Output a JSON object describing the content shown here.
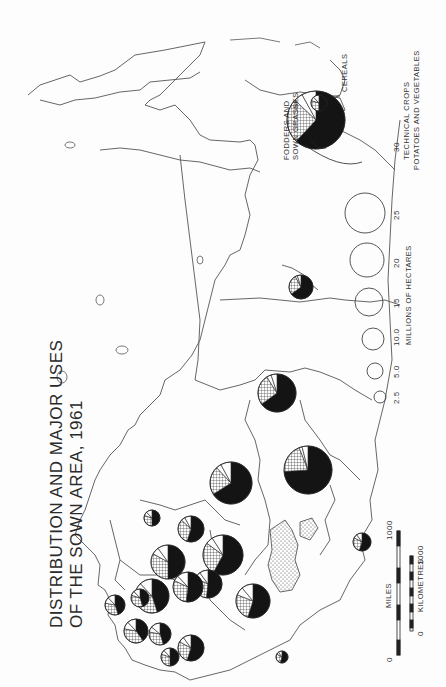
{
  "title": {
    "line1": "DISTRIBUTION AND MAJOR USES",
    "line2": "OF THE SOWN AREA, 1961"
  },
  "legend": {
    "unit_label": "MILLIONS OF HECTARES",
    "sizes": [
      "2.5",
      "5.0",
      "10.0",
      "15",
      "20",
      "25",
      "30"
    ],
    "categories": {
      "cereals": "CEREALS",
      "fodders": "FODDERS AND",
      "fodders2": "SOWN GRASSES",
      "technical": "TECHNICAL CROPS",
      "potatoes": "POTATOES AND VEGETABLES"
    },
    "sample_value": "30"
  },
  "scale": {
    "miles_label": "MILES",
    "km_label": "KILOMETRES",
    "miles_start": "0",
    "miles_end": "1000",
    "km_start": "0",
    "km_end": "1000"
  },
  "colors": {
    "ink": "#1a1a1a",
    "paper": "#fdfdfd",
    "outline": "#444444"
  },
  "chart_data": {
    "type": "pie-map",
    "title": "Distribution and Major Uses of the Sown Area, 1961",
    "size_unit": "Millions of hectares",
    "size_legend": [
      2.5,
      5.0,
      10.0,
      15,
      20,
      25,
      30
    ],
    "categories": [
      "Cereals",
      "Fodders and sown grasses",
      "Technical crops",
      "Potatoes and vegetables"
    ],
    "pies": [
      {
        "cx": 316,
        "cy": 120,
        "r": 29,
        "legend_sample": true,
        "shares": [
          0.62,
          0.25,
          0.05,
          0.08
        ]
      },
      {
        "cx": 301,
        "cy": 287,
        "r": 12,
        "shares": [
          0.65,
          0.27,
          0.03,
          0.05
        ]
      },
      {
        "cx": 277,
        "cy": 393,
        "r": 19,
        "shares": [
          0.65,
          0.26,
          0.04,
          0.05
        ]
      },
      {
        "cx": 308,
        "cy": 470,
        "r": 24,
        "shares": [
          0.74,
          0.2,
          0.02,
          0.04
        ]
      },
      {
        "cx": 231,
        "cy": 483,
        "r": 21,
        "shares": [
          0.66,
          0.22,
          0.04,
          0.08
        ]
      },
      {
        "cx": 223,
        "cy": 555,
        "r": 20,
        "shares": [
          0.58,
          0.27,
          0.06,
          0.09
        ]
      },
      {
        "cx": 191,
        "cy": 529,
        "r": 13,
        "shares": [
          0.55,
          0.32,
          0.05,
          0.08
        ]
      },
      {
        "cx": 168,
        "cy": 562,
        "r": 17,
        "shares": [
          0.5,
          0.33,
          0.07,
          0.1
        ]
      },
      {
        "cx": 208,
        "cy": 584,
        "r": 14,
        "shares": [
          0.52,
          0.3,
          0.08,
          0.1
        ]
      },
      {
        "cx": 188,
        "cy": 587,
        "r": 15,
        "shares": [
          0.52,
          0.3,
          0.06,
          0.12
        ]
      },
      {
        "cx": 253,
        "cy": 601,
        "r": 17,
        "shares": [
          0.55,
          0.26,
          0.08,
          0.11
        ]
      },
      {
        "cx": 152,
        "cy": 596,
        "r": 17,
        "shares": [
          0.45,
          0.34,
          0.09,
          0.12
        ]
      },
      {
        "cx": 140,
        "cy": 598,
        "r": 9,
        "shares": [
          0.45,
          0.35,
          0.08,
          0.12
        ]
      },
      {
        "cx": 136,
        "cy": 631,
        "r": 12,
        "shares": [
          0.4,
          0.38,
          0.1,
          0.12
        ]
      },
      {
        "cx": 160,
        "cy": 634,
        "r": 11,
        "shares": [
          0.45,
          0.33,
          0.08,
          0.14
        ]
      },
      {
        "cx": 170,
        "cy": 657,
        "r": 9,
        "shares": [
          0.5,
          0.3,
          0.08,
          0.12
        ]
      },
      {
        "cx": 191,
        "cy": 648,
        "r": 13,
        "shares": [
          0.55,
          0.28,
          0.07,
          0.1
        ]
      },
      {
        "cx": 115,
        "cy": 605,
        "r": 10,
        "shares": [
          0.45,
          0.33,
          0.1,
          0.12
        ]
      },
      {
        "cx": 152,
        "cy": 518,
        "r": 8,
        "shares": [
          0.5,
          0.3,
          0.08,
          0.12
        ]
      },
      {
        "cx": 362,
        "cy": 542,
        "r": 9,
        "shares": [
          0.55,
          0.28,
          0.07,
          0.1
        ]
      },
      {
        "cx": 282,
        "cy": 657,
        "r": 6,
        "shares": [
          0.55,
          0.28,
          0.07,
          0.1
        ]
      },
      {
        "cx": 319,
        "cy": 103,
        "r": 8,
        "shares": [
          0.5,
          0.3,
          0.08,
          0.12
        ]
      }
    ]
  }
}
